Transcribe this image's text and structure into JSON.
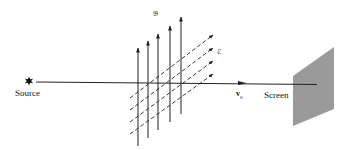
{
  "diagram": {
    "labels": {
      "source": "Source",
      "screen": "Screen",
      "magnetic_field": "𝔅",
      "electric_field": "ℰ",
      "velocity": "v",
      "velocity_subscript": "0"
    },
    "colors": {
      "line": "#222222",
      "screen_fill": "#9a9a9a",
      "background": "#ffffff"
    },
    "elements": {
      "source_marker": "star-burst",
      "magnetic_field_arrows": 5,
      "electric_field_arrows": 4
    }
  }
}
